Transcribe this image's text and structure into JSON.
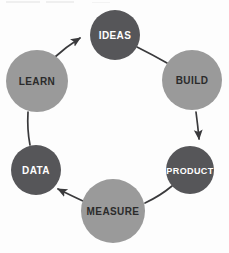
{
  "diagram": {
    "type": "cycle",
    "title": "",
    "palette": {
      "dark_fill": "#565659",
      "light_fill": "#9a9a9a",
      "dark_text": "#2b2b2b",
      "light_text": "#ffffff",
      "connector": "#3a3a3c",
      "background": "#fdfdfd"
    },
    "nodes": [
      {
        "id": "ideas",
        "label": "IDEAS",
        "cx": 115,
        "cy": 35,
        "r": 25,
        "fill": "#565659",
        "text_color": "#ffffff",
        "font_size": 10
      },
      {
        "id": "build",
        "label": "BUILD",
        "cx": 192,
        "cy": 80,
        "r": 30,
        "fill": "#9a9a9a",
        "text_color": "#2b2b2b",
        "font_size": 10
      },
      {
        "id": "product",
        "label": "PRODUCT",
        "cx": 190,
        "cy": 170,
        "r": 24,
        "fill": "#565659",
        "text_color": "#ffffff",
        "font_size": 9
      },
      {
        "id": "measure",
        "label": "MEASURE",
        "cx": 113,
        "cy": 211,
        "r": 32,
        "fill": "#9a9a9a",
        "text_color": "#2b2b2b",
        "font_size": 10
      },
      {
        "id": "data",
        "label": "DATA",
        "cx": 36,
        "cy": 170,
        "r": 25,
        "fill": "#565659",
        "text_color": "#ffffff",
        "font_size": 10
      },
      {
        "id": "learn",
        "label": "LEARN",
        "cx": 37,
        "cy": 81,
        "r": 31,
        "fill": "#9a9a9a",
        "text_color": "#2b2b2b",
        "font_size": 10
      }
    ],
    "connectors": [
      {
        "id": "ideas-to-build",
        "from": "ideas",
        "to": "build",
        "arrow": false,
        "path": "M 137 47 Q 153 55 167 63"
      },
      {
        "id": "build-to-product",
        "from": "build",
        "to": "product",
        "arrow": true,
        "path": "M 196 112 Q 198 127 199 139"
      },
      {
        "id": "product-to-measure",
        "from": "product",
        "to": "measure",
        "arrow": false,
        "path": "M 172 186 Q 160 196 145 203"
      },
      {
        "id": "measure-to-data",
        "from": "measure",
        "to": "data",
        "arrow": true,
        "path": "M 83 201 Q 72 196 58 189"
      },
      {
        "id": "data-to-learn",
        "from": "data",
        "to": "learn",
        "arrow": false,
        "path": "M 30 145 Q 27 130 28 112"
      },
      {
        "id": "learn-to-ideas",
        "from": "learn",
        "to": "ideas",
        "arrow": true,
        "path": "M 55 57 Q 66 47 80 38"
      }
    ]
  }
}
